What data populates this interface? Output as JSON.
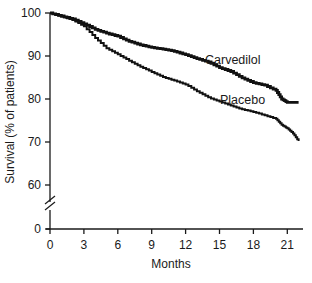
{
  "chart_data": {
    "type": "line",
    "title": "",
    "xlabel": "Months",
    "ylabel": "Survival (% of patients)",
    "xlim": [
      0,
      22
    ],
    "ylim": [
      0,
      100
    ],
    "y_axis_break": "between 0 and 60",
    "x_ticks": [
      0,
      3,
      6,
      9,
      12,
      15,
      18,
      21
    ],
    "y_ticks": [
      0,
      60,
      70,
      80,
      90,
      100
    ],
    "grid": false,
    "legend": "inline labels",
    "series": [
      {
        "name": "Carvedilol",
        "x": [
          0,
          1,
          2,
          3,
          4,
          5,
          6,
          7,
          8,
          9,
          10,
          11,
          12,
          13,
          14,
          15,
          16,
          17,
          18,
          19,
          20,
          20.5,
          21,
          22
        ],
        "values": [
          100,
          99.3,
          98.6,
          97.5,
          96.2,
          95.3,
          94.6,
          93.4,
          92.6,
          92.0,
          91.6,
          91.1,
          90.3,
          89.4,
          88.6,
          87.3,
          86.4,
          84.9,
          83.8,
          83.2,
          82.0,
          80.0,
          79.2,
          79.2
        ]
      },
      {
        "name": "Placebo",
        "x": [
          0,
          1,
          2,
          3,
          4,
          5,
          6,
          7,
          8,
          9,
          10,
          11,
          12,
          13,
          14,
          15,
          16,
          17,
          18,
          19,
          20,
          20.5,
          21,
          21.5,
          22
        ],
        "values": [
          100,
          99.2,
          98.4,
          96.9,
          94.2,
          91.8,
          90.4,
          88.9,
          87.5,
          86.3,
          85.1,
          84.3,
          83.4,
          81.8,
          80.4,
          79.4,
          78.5,
          77.6,
          77.0,
          76.2,
          75.4,
          74.0,
          73.2,
          72.0,
          70.2
        ]
      }
    ]
  },
  "axes": {
    "xlabel": "Months",
    "ylabel": "Survival (% of patients)",
    "x_tick_labels": [
      "0",
      "3",
      "6",
      "9",
      "12",
      "15",
      "18",
      "21"
    ],
    "y_tick_labels": [
      "100",
      "90",
      "80",
      "70",
      "60",
      "0"
    ]
  },
  "labels": {
    "carvedilol": "Carvedilol",
    "placebo": "Placebo"
  },
  "colors": {
    "line": "#111111",
    "axis": "#1a1a1a"
  }
}
